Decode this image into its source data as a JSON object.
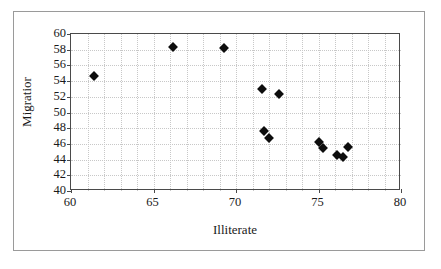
{
  "chart_data": {
    "type": "scatter",
    "title": "",
    "xlabel": "Illiterate",
    "ylabel": "Migratior",
    "xlim": [
      60,
      80
    ],
    "ylim": [
      40,
      60
    ],
    "xticks": [
      60,
      65,
      70,
      75,
      80
    ],
    "yticks": [
      40,
      42,
      44,
      46,
      48,
      50,
      52,
      54,
      56,
      58,
      60
    ],
    "grid": "dotted-both",
    "legend": "none",
    "marker": "filled-diamond",
    "marker_color": "#0d0d0d",
    "points": [
      {
        "x": 61.4,
        "y": 54.6
      },
      {
        "x": 66.2,
        "y": 58.3
      },
      {
        "x": 69.3,
        "y": 58.2
      },
      {
        "x": 71.6,
        "y": 53.0
      },
      {
        "x": 72.6,
        "y": 52.3
      },
      {
        "x": 71.7,
        "y": 47.7
      },
      {
        "x": 72.0,
        "y": 46.7
      },
      {
        "x": 75.0,
        "y": 46.2
      },
      {
        "x": 75.3,
        "y": 45.5
      },
      {
        "x": 76.1,
        "y": 44.6
      },
      {
        "x": 76.5,
        "y": 44.3
      },
      {
        "x": 76.8,
        "y": 45.6
      }
    ]
  },
  "axes": {
    "x_title": "Illiterate",
    "y_title": "Migratior",
    "x_tick_labels": [
      "60",
      "65",
      "70",
      "75",
      "80"
    ],
    "y_tick_labels": [
      "40",
      "42",
      "44",
      "46",
      "48",
      "50",
      "52",
      "54",
      "56",
      "58",
      "60"
    ]
  },
  "style": {
    "plot_border_color": "#4a4a4a",
    "frame_border_color": "#9a9a9a",
    "gridline_color": "#c8c8c8",
    "background": "#ffffff",
    "text_color": "#1a1a1a"
  }
}
